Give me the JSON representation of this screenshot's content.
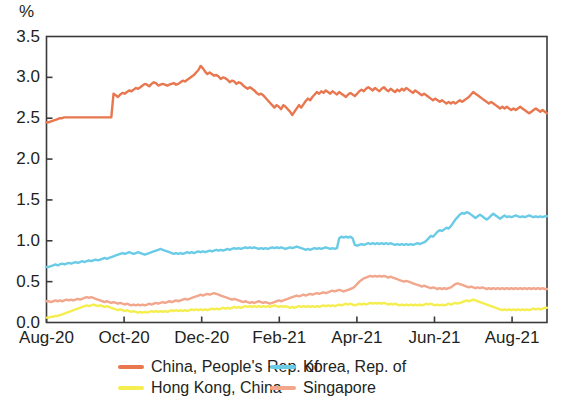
{
  "chart_data": {
    "type": "line",
    "title": "",
    "subtitle": "",
    "xlabel": "",
    "ylabel": "%",
    "unit_label": "%",
    "grid": false,
    "legend_position": "bottom",
    "ylim": [
      0.0,
      3.5
    ],
    "ytick_labels": [
      "3.5",
      "3.0",
      "2.5",
      "2.0",
      "1.5",
      "1.0",
      "0.5",
      "0.0"
    ],
    "ytick_values": [
      3.5,
      3.0,
      2.5,
      2.0,
      1.5,
      1.0,
      0.5,
      0.0
    ],
    "xtick_labels": [
      "Aug-20",
      "Oct-20",
      "Dec-20",
      "Feb-21",
      "Apr-21",
      "Jun-21",
      "Aug-21"
    ],
    "xtick_values": [
      0,
      2,
      4,
      6,
      8,
      10,
      12
    ],
    "xlim": [
      0,
      12.9
    ],
    "series": [
      {
        "name": "China, People's Rep. of",
        "color": "#e8764f",
        "values": [
          2.45,
          2.45,
          2.46,
          2.47,
          2.48,
          2.49,
          2.5,
          2.5,
          2.51,
          2.51,
          2.51,
          2.51,
          2.51,
          2.51,
          2.51,
          2.51,
          2.51,
          2.51,
          2.51,
          2.51,
          2.51,
          2.51,
          2.51,
          2.51,
          2.51,
          2.51,
          2.51,
          2.51,
          2.51,
          2.51,
          2.8,
          2.78,
          2.76,
          2.79,
          2.81,
          2.8,
          2.82,
          2.84,
          2.83,
          2.85,
          2.87,
          2.86,
          2.88,
          2.9,
          2.92,
          2.91,
          2.89,
          2.92,
          2.94,
          2.93,
          2.9,
          2.91,
          2.92,
          2.91,
          2.9,
          2.91,
          2.92,
          2.93,
          2.91,
          2.92,
          2.94,
          2.96,
          2.95,
          2.97,
          2.99,
          3.01,
          3.03,
          3.06,
          3.09,
          3.14,
          3.11,
          3.07,
          3.04,
          3.06,
          3.04,
          3.02,
          3.03,
          3.01,
          2.98,
          3.0,
          2.99,
          2.97,
          2.94,
          2.96,
          2.95,
          2.92,
          2.94,
          2.93,
          2.9,
          2.88,
          2.86,
          2.88,
          2.86,
          2.84,
          2.81,
          2.79,
          2.8,
          2.78,
          2.75,
          2.72,
          2.69,
          2.66,
          2.63,
          2.66,
          2.64,
          2.61,
          2.66,
          2.64,
          2.61,
          2.58,
          2.54,
          2.58,
          2.62,
          2.66,
          2.63,
          2.67,
          2.71,
          2.74,
          2.72,
          2.76,
          2.79,
          2.82,
          2.8,
          2.83,
          2.81,
          2.84,
          2.82,
          2.8,
          2.83,
          2.81,
          2.79,
          2.82,
          2.8,
          2.78,
          2.76,
          2.79,
          2.81,
          2.79,
          2.77,
          2.8,
          2.83,
          2.85,
          2.83,
          2.86,
          2.88,
          2.86,
          2.84,
          2.87,
          2.85,
          2.83,
          2.86,
          2.88,
          2.85,
          2.83,
          2.86,
          2.84,
          2.82,
          2.85,
          2.83,
          2.86,
          2.84,
          2.87,
          2.85,
          2.83,
          2.81,
          2.84,
          2.82,
          2.8,
          2.78,
          2.8,
          2.78,
          2.76,
          2.74,
          2.72,
          2.74,
          2.72,
          2.7,
          2.72,
          2.7,
          2.68,
          2.7,
          2.68,
          2.7,
          2.68,
          2.7,
          2.72,
          2.7,
          2.72,
          2.74,
          2.76,
          2.79,
          2.82,
          2.8,
          2.78,
          2.76,
          2.74,
          2.72,
          2.7,
          2.68,
          2.7,
          2.68,
          2.66,
          2.64,
          2.62,
          2.64,
          2.62,
          2.64,
          2.62,
          2.6,
          2.62,
          2.6,
          2.62,
          2.64,
          2.62,
          2.6,
          2.58,
          2.56,
          2.58,
          2.6,
          2.62,
          2.6,
          2.58,
          2.6,
          2.58,
          2.56
        ]
      },
      {
        "name": "Korea, Rep. of",
        "color": "#69cbe6",
        "values": [
          0.68,
          0.68,
          0.69,
          0.7,
          0.71,
          0.7,
          0.71,
          0.72,
          0.71,
          0.72,
          0.73,
          0.72,
          0.73,
          0.74,
          0.73,
          0.74,
          0.75,
          0.74,
          0.75,
          0.76,
          0.75,
          0.76,
          0.77,
          0.76,
          0.77,
          0.78,
          0.79,
          0.78,
          0.79,
          0.8,
          0.81,
          0.82,
          0.83,
          0.84,
          0.85,
          0.84,
          0.85,
          0.86,
          0.85,
          0.84,
          0.85,
          0.86,
          0.85,
          0.84,
          0.83,
          0.84,
          0.85,
          0.86,
          0.87,
          0.88,
          0.89,
          0.9,
          0.89,
          0.88,
          0.87,
          0.86,
          0.85,
          0.84,
          0.85,
          0.84,
          0.85,
          0.84,
          0.85,
          0.86,
          0.85,
          0.86,
          0.85,
          0.86,
          0.87,
          0.86,
          0.87,
          0.86,
          0.87,
          0.88,
          0.87,
          0.88,
          0.89,
          0.88,
          0.89,
          0.88,
          0.89,
          0.9,
          0.89,
          0.9,
          0.91,
          0.9,
          0.91,
          0.9,
          0.91,
          0.92,
          0.91,
          0.92,
          0.91,
          0.92,
          0.91,
          0.9,
          0.91,
          0.9,
          0.91,
          0.9,
          0.91,
          0.92,
          0.91,
          0.92,
          0.91,
          0.92,
          0.91,
          0.9,
          0.91,
          0.92,
          0.91,
          0.92,
          0.93,
          0.92,
          0.91,
          0.9,
          0.89,
          0.9,
          0.89,
          0.9,
          0.91,
          0.9,
          0.91,
          0.9,
          0.91,
          0.92,
          0.91,
          0.9,
          0.91,
          0.9,
          0.91,
          1.03,
          1.05,
          1.04,
          1.05,
          1.04,
          1.05,
          1.03,
          0.95,
          0.94,
          0.95,
          0.96,
          0.95,
          0.96,
          0.97,
          0.96,
          0.97,
          0.96,
          0.97,
          0.96,
          0.97,
          0.96,
          0.97,
          0.96,
          0.97,
          0.96,
          0.95,
          0.96,
          0.95,
          0.96,
          0.95,
          0.96,
          0.95,
          0.96,
          0.95,
          0.96,
          0.97,
          0.96,
          0.97,
          0.98,
          1.0,
          1.03,
          1.06,
          1.05,
          1.08,
          1.11,
          1.13,
          1.12,
          1.14,
          1.16,
          1.15,
          1.18,
          1.22,
          1.26,
          1.29,
          1.32,
          1.34,
          1.33,
          1.35,
          1.34,
          1.32,
          1.3,
          1.28,
          1.3,
          1.32,
          1.3,
          1.28,
          1.26,
          1.28,
          1.31,
          1.33,
          1.31,
          1.29,
          1.27,
          1.29,
          1.31,
          1.29,
          1.3,
          1.29,
          1.3,
          1.31,
          1.3,
          1.29,
          1.3,
          1.29,
          1.3,
          1.31,
          1.3,
          1.29,
          1.3,
          1.29,
          1.3,
          1.29,
          1.3,
          1.3
        ]
      },
      {
        "name": "Hong Kong, China",
        "color": "#f4ee4f",
        "values": [
          0.06,
          0.06,
          0.07,
          0.07,
          0.08,
          0.08,
          0.09,
          0.1,
          0.11,
          0.12,
          0.13,
          0.14,
          0.15,
          0.16,
          0.17,
          0.18,
          0.19,
          0.2,
          0.21,
          0.2,
          0.21,
          0.22,
          0.21,
          0.2,
          0.21,
          0.2,
          0.19,
          0.2,
          0.19,
          0.18,
          0.17,
          0.16,
          0.15,
          0.16,
          0.15,
          0.14,
          0.15,
          0.14,
          0.13,
          0.14,
          0.13,
          0.12,
          0.13,
          0.12,
          0.13,
          0.12,
          0.13,
          0.14,
          0.13,
          0.14,
          0.13,
          0.14,
          0.13,
          0.14,
          0.13,
          0.14,
          0.15,
          0.14,
          0.15,
          0.14,
          0.15,
          0.14,
          0.15,
          0.14,
          0.15,
          0.16,
          0.15,
          0.16,
          0.15,
          0.16,
          0.15,
          0.16,
          0.15,
          0.16,
          0.17,
          0.16,
          0.17,
          0.16,
          0.17,
          0.18,
          0.17,
          0.18,
          0.17,
          0.18,
          0.19,
          0.18,
          0.19,
          0.18,
          0.19,
          0.2,
          0.19,
          0.2,
          0.19,
          0.2,
          0.19,
          0.2,
          0.19,
          0.2,
          0.19,
          0.2,
          0.19,
          0.2,
          0.21,
          0.2,
          0.19,
          0.2,
          0.19,
          0.2,
          0.19,
          0.18,
          0.19,
          0.18,
          0.19,
          0.2,
          0.19,
          0.2,
          0.19,
          0.2,
          0.19,
          0.2,
          0.19,
          0.2,
          0.19,
          0.2,
          0.21,
          0.2,
          0.21,
          0.2,
          0.21,
          0.2,
          0.21,
          0.22,
          0.21,
          0.22,
          0.23,
          0.22,
          0.23,
          0.22,
          0.21,
          0.22,
          0.23,
          0.22,
          0.23,
          0.22,
          0.23,
          0.24,
          0.23,
          0.24,
          0.23,
          0.24,
          0.23,
          0.24,
          0.23,
          0.22,
          0.23,
          0.22,
          0.23,
          0.22,
          0.21,
          0.22,
          0.21,
          0.22,
          0.21,
          0.22,
          0.21,
          0.22,
          0.21,
          0.22,
          0.21,
          0.22,
          0.23,
          0.22,
          0.23,
          0.22,
          0.21,
          0.22,
          0.21,
          0.22,
          0.21,
          0.22,
          0.23,
          0.22,
          0.23,
          0.24,
          0.23,
          0.24,
          0.25,
          0.26,
          0.27,
          0.26,
          0.27,
          0.28,
          0.27,
          0.26,
          0.25,
          0.24,
          0.23,
          0.22,
          0.21,
          0.2,
          0.19,
          0.18,
          0.17,
          0.16,
          0.15,
          0.16,
          0.15,
          0.16,
          0.15,
          0.16,
          0.15,
          0.16,
          0.15,
          0.16,
          0.15,
          0.16,
          0.15,
          0.16,
          0.17,
          0.16,
          0.17,
          0.16,
          0.17,
          0.18,
          0.18
        ]
      },
      {
        "name": "Singapore",
        "color": "#f2a68c",
        "values": [
          0.26,
          0.26,
          0.25,
          0.26,
          0.27,
          0.26,
          0.27,
          0.26,
          0.27,
          0.28,
          0.27,
          0.28,
          0.27,
          0.28,
          0.29,
          0.28,
          0.29,
          0.3,
          0.31,
          0.3,
          0.31,
          0.3,
          0.29,
          0.28,
          0.27,
          0.26,
          0.25,
          0.26,
          0.25,
          0.24,
          0.25,
          0.24,
          0.23,
          0.24,
          0.23,
          0.22,
          0.23,
          0.22,
          0.21,
          0.22,
          0.21,
          0.22,
          0.21,
          0.22,
          0.21,
          0.22,
          0.23,
          0.22,
          0.23,
          0.24,
          0.23,
          0.24,
          0.25,
          0.24,
          0.25,
          0.26,
          0.25,
          0.26,
          0.27,
          0.26,
          0.27,
          0.28,
          0.29,
          0.28,
          0.29,
          0.3,
          0.31,
          0.32,
          0.33,
          0.34,
          0.33,
          0.34,
          0.35,
          0.34,
          0.35,
          0.36,
          0.35,
          0.34,
          0.33,
          0.32,
          0.31,
          0.3,
          0.29,
          0.28,
          0.29,
          0.28,
          0.27,
          0.26,
          0.25,
          0.26,
          0.25,
          0.24,
          0.25,
          0.24,
          0.25,
          0.26,
          0.25,
          0.24,
          0.25,
          0.24,
          0.23,
          0.24,
          0.25,
          0.26,
          0.27,
          0.26,
          0.27,
          0.28,
          0.29,
          0.3,
          0.31,
          0.32,
          0.33,
          0.32,
          0.33,
          0.34,
          0.33,
          0.34,
          0.35,
          0.34,
          0.35,
          0.36,
          0.35,
          0.36,
          0.37,
          0.36,
          0.37,
          0.38,
          0.39,
          0.38,
          0.39,
          0.4,
          0.39,
          0.38,
          0.39,
          0.4,
          0.41,
          0.42,
          0.44,
          0.47,
          0.5,
          0.52,
          0.54,
          0.55,
          0.56,
          0.57,
          0.56,
          0.57,
          0.56,
          0.57,
          0.56,
          0.57,
          0.56,
          0.55,
          0.56,
          0.55,
          0.54,
          0.53,
          0.52,
          0.51,
          0.5,
          0.51,
          0.5,
          0.49,
          0.48,
          0.47,
          0.46,
          0.45,
          0.44,
          0.45,
          0.44,
          0.43,
          0.42,
          0.43,
          0.42,
          0.41,
          0.42,
          0.41,
          0.42,
          0.41,
          0.42,
          0.43,
          0.45,
          0.47,
          0.48,
          0.47,
          0.46,
          0.45,
          0.44,
          0.43,
          0.44,
          0.43,
          0.42,
          0.43,
          0.42,
          0.43,
          0.42,
          0.41,
          0.42,
          0.41,
          0.42,
          0.41,
          0.42,
          0.41,
          0.42,
          0.41,
          0.42,
          0.41,
          0.42,
          0.41,
          0.42,
          0.41,
          0.42,
          0.41,
          0.42,
          0.41,
          0.42,
          0.41,
          0.42,
          0.41,
          0.42,
          0.41,
          0.42,
          0.41,
          0.41
        ]
      }
    ]
  },
  "legend": {
    "entries": [
      {
        "label": "China, People's Rep. of",
        "color": "#e8764f"
      },
      {
        "label": "Korea, Rep. of",
        "color": "#69cbe6"
      },
      {
        "label": "Hong Kong, China",
        "color": "#f4ee4f"
      },
      {
        "label": "Singapore",
        "color": "#f2a68c"
      }
    ]
  },
  "axis": {
    "frame_color": "#3a3a3a"
  }
}
